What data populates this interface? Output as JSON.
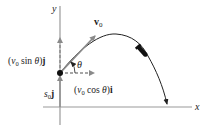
{
  "diagram": {
    "axes": {
      "x_label": "x",
      "y_label": "y"
    },
    "labels": {
      "v0_vector": {
        "base": "v",
        "sub": "0"
      },
      "theta": "θ",
      "vertical_component": {
        "prefix": "(",
        "v": "v",
        "sub": "0",
        "middle": " sin ",
        "theta": "θ",
        "suffix": ")",
        "unit": "j"
      },
      "horizontal_component": {
        "prefix": "(",
        "v": "v",
        "sub": "0",
        "middle": " cos ",
        "theta": "θ",
        "suffix": ")",
        "unit": "i"
      },
      "initial_position": {
        "s": "s",
        "sub": "0",
        "unit": "j"
      }
    },
    "colors": {
      "axis": "#9a9a9a",
      "component_arrows": "#8a8a8a",
      "velocity_arrow": "#8a8a8a",
      "trajectory": "#222222",
      "origin_point": "#111111",
      "projectile": "#111111",
      "text": "#222222"
    }
  }
}
